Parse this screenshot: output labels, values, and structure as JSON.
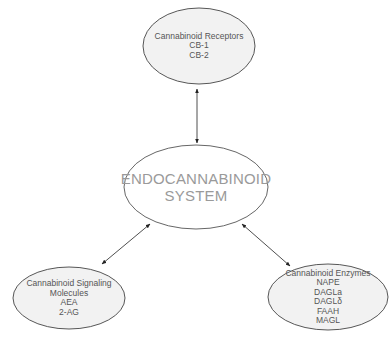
{
  "diagram": {
    "center": {
      "lines": [
        "ENDOCANNABINOID",
        "SYSTEM"
      ]
    },
    "nodes": {
      "receptors": {
        "lines": [
          "Cannabinoid Receptors",
          "CB-1",
          "CB-2"
        ]
      },
      "signaling": {
        "lines": [
          "Cannabinoid Signaling",
          "Molecules",
          "AEA",
          "2-AG"
        ]
      },
      "enzymes": {
        "lines": [
          "Cannabinoid Enzymes",
          "NAPE",
          "DAGLa",
          "DAGLδ",
          "FAAH",
          "MAGL"
        ]
      }
    },
    "edges": [
      {
        "from": "center",
        "to": "receptors",
        "type": "bidirectional-arrow"
      },
      {
        "from": "center",
        "to": "signaling",
        "type": "bidirectional-arrow"
      },
      {
        "from": "center",
        "to": "enzymes",
        "type": "bidirectional-arrow"
      }
    ],
    "colors": {
      "ellipse_fill": "#f2f2f2",
      "ellipse_stroke": "#444444",
      "arrow": "#222222",
      "center_text": "#9a9a9a",
      "node_text": "#555555"
    }
  }
}
